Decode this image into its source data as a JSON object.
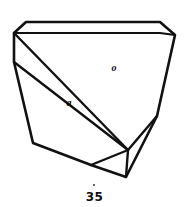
{
  "figure": {
    "kind": "crystal-habit-line-drawing",
    "number": "35",
    "background_color": "#ffffff",
    "stroke_color": "#111111",
    "label_color": "#0b0b0b",
    "labels": [
      {
        "id": "o",
        "text": "o",
        "x": 113,
        "y": 69,
        "meaning": "face-o"
      },
      {
        "id": "a",
        "text": "a",
        "x": 69,
        "y": 104,
        "meaning": "face-a"
      }
    ],
    "geometry": {
      "vertices": {
        "top_back_left": [
          26,
          22
        ],
        "top_back_right": [
          160,
          22
        ],
        "top_front_right": [
          175,
          35
        ],
        "top_front_left_upper": [
          14,
          33
        ],
        "top_inner_left": [
          14,
          33
        ],
        "top_inner_right": [
          160,
          33
        ],
        "left_upper": [
          14,
          33
        ],
        "left_mid": [
          14,
          62
        ],
        "left_lower": [
          33,
          143
        ],
        "bottom_notch": [
          91,
          165
        ],
        "bottom_right": [
          126,
          177
        ],
        "right_mid": [
          157,
          116
        ],
        "right_upper": [
          175,
          35
        ],
        "inner_apex": [
          128,
          150
        ]
      },
      "outline": [
        [
          26,
          22
        ],
        [
          160,
          22
        ],
        [
          175,
          35
        ],
        [
          157,
          116
        ],
        [
          126,
          177
        ],
        [
          91,
          165
        ],
        [
          33,
          143
        ],
        [
          14,
          62
        ],
        [
          14,
          33
        ]
      ],
      "top_face_inner_edge": [
        [
          14,
          33
        ],
        [
          160,
          33
        ],
        [
          175,
          35
        ]
      ],
      "edge_o_face": [
        [
          14,
          33
        ],
        [
          128,
          150
        ]
      ],
      "edge_right_inner": [
        [
          128,
          150
        ],
        [
          157,
          116
        ]
      ],
      "edge_a_face": [
        [
          14,
          62
        ],
        [
          128,
          150
        ]
      ],
      "edge_bottom_inner": [
        [
          91,
          165
        ],
        [
          128,
          150
        ]
      ],
      "edge_bottom_right": [
        [
          126,
          177
        ],
        [
          128,
          150
        ]
      ]
    }
  }
}
